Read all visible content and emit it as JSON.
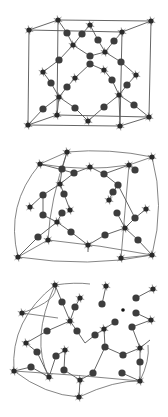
{
  "figure": {
    "colors": {
      "background": "#ffffff",
      "node": "#3d3d3d",
      "star_node": "#2a2a2a",
      "edge": "#555555"
    },
    "panels": [
      {
        "name": "ordered-cubic-lattice",
        "stars": [
          [
            58,
            20
          ],
          [
            29,
            30
          ],
          [
            151,
            21
          ],
          [
            122,
            32
          ],
          [
            90,
            25
          ],
          [
            73,
            45
          ],
          [
            105,
            52
          ],
          [
            43,
            72
          ],
          [
            75,
            78
          ],
          [
            136,
            75
          ],
          [
            104,
            70
          ],
          [
            59,
            97
          ],
          [
            119,
            95
          ],
          [
            57,
            115
          ],
          [
            28,
            125
          ],
          [
            88,
            121
          ],
          [
            149,
            117
          ],
          [
            120,
            126
          ]
        ],
        "balls": [
          [
            67,
            33
          ],
          [
            82,
            34
          ],
          [
            98,
            40
          ],
          [
            114,
            41
          ],
          [
            59,
            60
          ],
          [
            90,
            56
          ],
          [
            90,
            64
          ],
          [
            121,
            62
          ],
          [
            51,
            83
          ],
          [
            67,
            87
          ],
          [
            112,
            80
          ],
          [
            127,
            85
          ],
          [
            43,
            109
          ],
          [
            75,
            108
          ],
          [
            104,
            107
          ],
          [
            134,
            105
          ]
        ],
        "edges": [
          [
            58,
            20,
            151,
            21
          ],
          [
            29,
            30,
            122,
            32
          ],
          [
            58,
            20,
            29,
            30
          ],
          [
            151,
            21,
            122,
            32
          ],
          [
            29,
            30,
            28,
            125
          ],
          [
            122,
            32,
            120,
            126
          ],
          [
            151,
            21,
            149,
            117
          ],
          [
            58,
            20,
            57,
            115
          ],
          [
            28,
            125,
            120,
            126
          ],
          [
            57,
            115,
            149,
            117
          ],
          [
            28,
            125,
            57,
            115
          ],
          [
            120,
            126,
            149,
            117
          ],
          [
            90,
            25,
            98,
            40
          ],
          [
            98,
            40,
            105,
            52
          ],
          [
            105,
            52,
            114,
            41
          ],
          [
            114,
            41,
            122,
            32
          ],
          [
            73,
            45,
            82,
            34
          ],
          [
            82,
            34,
            90,
            25
          ],
          [
            73,
            45,
            67,
            33
          ],
          [
            67,
            33,
            58,
            20
          ],
          [
            73,
            45,
            59,
            60
          ],
          [
            59,
            60,
            43,
            72
          ],
          [
            73,
            45,
            90,
            56
          ],
          [
            90,
            56,
            105,
            52
          ],
          [
            105,
            52,
            121,
            62
          ],
          [
            121,
            62,
            136,
            75
          ],
          [
            90,
            64,
            104,
            70
          ],
          [
            90,
            64,
            75,
            78
          ],
          [
            104,
            70,
            112,
            80
          ],
          [
            112,
            80,
            119,
            95
          ],
          [
            136,
            75,
            127,
            85
          ],
          [
            127,
            85,
            119,
            95
          ],
          [
            75,
            78,
            67,
            87
          ],
          [
            67,
            87,
            59,
            97
          ],
          [
            43,
            72,
            51,
            83
          ],
          [
            51,
            83,
            59,
            97
          ],
          [
            59,
            97,
            43,
            109
          ],
          [
            43,
            109,
            28,
            125
          ],
          [
            59,
            97,
            75,
            108
          ],
          [
            75,
            108,
            88,
            121
          ],
          [
            88,
            121,
            104,
            107
          ],
          [
            104,
            107,
            119,
            95
          ],
          [
            119,
            95,
            134,
            105
          ],
          [
            134,
            105,
            149,
            117
          ],
          [
            59,
            97,
            57,
            115
          ],
          [
            119,
            95,
            120,
            126
          ]
        ]
      },
      {
        "name": "distorted-lattice",
        "stars": [
          [
            67,
            152
          ],
          [
            40,
            164
          ],
          [
            152,
            157
          ],
          [
            129,
            165
          ],
          [
            90,
            167
          ],
          [
            60,
            184
          ],
          [
            30,
            207
          ],
          [
            70,
            210
          ],
          [
            146,
            209
          ],
          [
            109,
            200
          ],
          [
            57,
            222
          ],
          [
            125,
            228
          ],
          [
            48,
            240
          ],
          [
            18,
            257
          ],
          [
            88,
            245
          ],
          [
            121,
            258
          ],
          [
            152,
            255
          ]
        ],
        "balls": [
          [
            62,
            169
          ],
          [
            74,
            173
          ],
          [
            104,
            174
          ],
          [
            135,
            170
          ],
          [
            118,
            185
          ],
          [
            43,
            195
          ],
          [
            64,
            194
          ],
          [
            113,
            192
          ],
          [
            43,
            215
          ],
          [
            62,
            213
          ],
          [
            117,
            213
          ],
          [
            135,
            218
          ],
          [
            71,
            232
          ],
          [
            105,
            235
          ],
          [
            38,
            237
          ],
          [
            138,
            240
          ]
        ],
        "curves": [
          "M67,152 Q110,148 152,157",
          "M40,164 Q85,172 129,165",
          "M67,152 L40,164",
          "M152,157 L129,165",
          "M40,164 Q5,205 18,257",
          "M152,157 Q165,205 152,255",
          "M18,257 Q90,268 152,255",
          "M48,240 Q100,245 152,255",
          "M67,152 Q50,200 48,240",
          "M129,165 Q125,210 121,258",
          "M18,257 L48,240",
          "M121,258 L152,255"
        ],
        "edges": [
          [
            67,
            152,
            62,
            169
          ],
          [
            62,
            169,
            60,
            184
          ],
          [
            40,
            164,
            74,
            173
          ],
          [
            74,
            173,
            90,
            167
          ],
          [
            90,
            167,
            104,
            174
          ],
          [
            104,
            174,
            129,
            165
          ],
          [
            129,
            165,
            135,
            170
          ],
          [
            74,
            173,
            60,
            184
          ],
          [
            104,
            174,
            118,
            185
          ],
          [
            60,
            184,
            64,
            194
          ],
          [
            60,
            184,
            43,
            195
          ],
          [
            43,
            195,
            30,
            207
          ],
          [
            43,
            195,
            43,
            215
          ],
          [
            64,
            194,
            70,
            210
          ],
          [
            118,
            185,
            113,
            192
          ],
          [
            118,
            185,
            135,
            218
          ],
          [
            113,
            192,
            109,
            200
          ],
          [
            135,
            218,
            146,
            209
          ],
          [
            43,
            215,
            57,
            222
          ],
          [
            62,
            213,
            57,
            222
          ],
          [
            117,
            213,
            125,
            228
          ],
          [
            135,
            218,
            125,
            228
          ],
          [
            57,
            222,
            71,
            232
          ],
          [
            71,
            232,
            88,
            245
          ],
          [
            88,
            245,
            105,
            235
          ],
          [
            105,
            235,
            125,
            228
          ],
          [
            125,
            228,
            138,
            240
          ],
          [
            138,
            240,
            152,
            255
          ],
          [
            57,
            222,
            38,
            237
          ],
          [
            38,
            237,
            18,
            257
          ],
          [
            88,
            245,
            88,
            252
          ]
        ]
      },
      {
        "name": "disordered-network",
        "stars": [
          [
            55,
            285
          ],
          [
            106,
            286
          ],
          [
            153,
            289
          ],
          [
            80,
            298
          ],
          [
            22,
            313
          ],
          [
            70,
            321
          ],
          [
            151,
            320
          ],
          [
            104,
            329
          ],
          [
            26,
            343
          ],
          [
            65,
            350
          ],
          [
            140,
            348
          ],
          [
            14,
            371
          ],
          [
            49,
            377
          ],
          [
            80,
            380
          ],
          [
            140,
            381
          ],
          [
            79,
            397
          ]
        ],
        "balls": [
          [
            62,
            302
          ],
          [
            75,
            307
          ],
          [
            102,
            304
          ],
          [
            136,
            298
          ],
          [
            115,
            322
          ],
          [
            136,
            313
          ],
          [
            47,
            331
          ],
          [
            77,
            331
          ],
          [
            95,
            335
          ],
          [
            132,
            327
          ],
          [
            105,
            347
          ],
          [
            37,
            352
          ],
          [
            56,
            356
          ],
          [
            123,
            355
          ],
          [
            31,
            367
          ],
          [
            64,
            370
          ],
          [
            93,
            373
          ],
          [
            122,
            373
          ],
          [
            140,
            362
          ]
        ],
        "small_dots": [
          [
            123,
            310
          ]
        ],
        "curves": [
          "M55,285 Q75,282 90,284",
          "M55,285 Q10,320 14,371",
          "M55,285 Q30,340 49,377",
          "M14,371 Q45,395 79,397",
          "M79,397 Q115,380 140,381",
          "M22,313 L58,318",
          "M22,313 Q60,300 55,285",
          "M14,371 Q80,375 140,381",
          "M140,381 Q150,360 148,345"
        ],
        "edges": [
          [
            55,
            285,
            62,
            302
          ],
          [
            62,
            302,
            70,
            321
          ],
          [
            80,
            298,
            75,
            307
          ],
          [
            75,
            307,
            70,
            321
          ],
          [
            70,
            321,
            47,
            331
          ],
          [
            47,
            331,
            26,
            343
          ],
          [
            70,
            321,
            77,
            331
          ],
          [
            77,
            331,
            85,
            343
          ],
          [
            85,
            343,
            95,
            335
          ],
          [
            95,
            335,
            104,
            329
          ],
          [
            104,
            329,
            115,
            322
          ],
          [
            104,
            329,
            105,
            347
          ],
          [
            105,
            347,
            93,
            373
          ],
          [
            105,
            347,
            123,
            355
          ],
          [
            123,
            355,
            140,
            348
          ],
          [
            140,
            348,
            140,
            362
          ],
          [
            140,
            362,
            140,
            381
          ],
          [
            140,
            348,
            150,
            340
          ],
          [
            132,
            327,
            151,
            320
          ],
          [
            136,
            313,
            151,
            320
          ],
          [
            136,
            298,
            153,
            289
          ],
          [
            132,
            327,
            140,
            348
          ],
          [
            26,
            343,
            37,
            352
          ],
          [
            37,
            352,
            49,
            377
          ],
          [
            49,
            377,
            31,
            367
          ],
          [
            31,
            367,
            14,
            371
          ],
          [
            49,
            377,
            56,
            356
          ],
          [
            56,
            356,
            65,
            350
          ],
          [
            65,
            350,
            64,
            370
          ],
          [
            64,
            370,
            80,
            380
          ],
          [
            80,
            380,
            79,
            397
          ],
          [
            93,
            373,
            80,
            380
          ],
          [
            122,
            373,
            140,
            381
          ],
          [
            102,
            304,
            106,
            286
          ]
        ]
      }
    ]
  }
}
